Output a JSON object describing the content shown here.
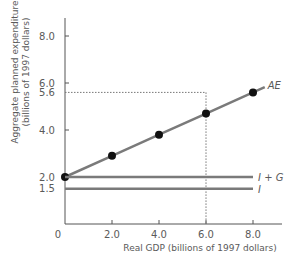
{
  "chart_data": {
    "type": "line",
    "title": "",
    "xlabel": "Real GDP (billions of 1997 dollars)",
    "ylabel_line1": "Aggregate planned expenditure",
    "ylabel_line2": "(billions of 1997 dollars)",
    "xlim": [
      0,
      9.0
    ],
    "ylim": [
      0,
      9.0
    ],
    "grid": false,
    "x_ticks": [
      {
        "value": 0,
        "label": "0"
      },
      {
        "value": 2.0,
        "label": "2.0"
      },
      {
        "value": 4.0,
        "label": "4.0"
      },
      {
        "value": 6.0,
        "label": "6.0"
      },
      {
        "value": 8.0,
        "label": "8.0"
      }
    ],
    "y_ticks": [
      {
        "value": 1.5,
        "label": "1.5"
      },
      {
        "value": 2.0,
        "label": "2.0"
      },
      {
        "value": 4.0,
        "label": "4.0"
      },
      {
        "value": 5.6,
        "label": "5.6"
      },
      {
        "value": 6.0,
        "label": "6.0"
      },
      {
        "value": 8.0,
        "label": "8.0"
      }
    ],
    "series": [
      {
        "name": "AE",
        "label": "AE",
        "x": [
          0,
          2.0,
          4.0,
          6.0,
          8.0
        ],
        "y": [
          2.0,
          2.9,
          3.8,
          4.7,
          5.6
        ],
        "markers": true,
        "color": "#7a7a7a"
      },
      {
        "name": "I + G",
        "label": "I + G",
        "x": [
          0,
          8.0
        ],
        "y": [
          2.0,
          2.0
        ],
        "markers": false,
        "color": "#7a7a7a"
      },
      {
        "name": "I",
        "label": "I",
        "x": [
          0,
          8.0
        ],
        "y": [
          1.5,
          1.5
        ],
        "markers": false,
        "color": "#7a7a7a"
      }
    ],
    "annotations": [
      {
        "type": "dotted-guide",
        "x": 6.0,
        "y": 5.6
      }
    ]
  }
}
